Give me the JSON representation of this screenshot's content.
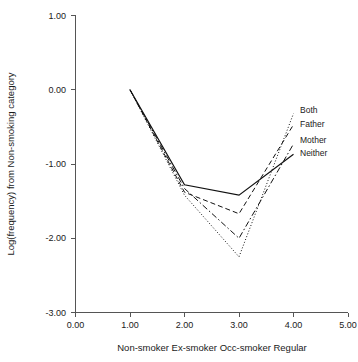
{
  "chart_data": {
    "type": "line",
    "title": "",
    "subtitle": "",
    "xlabel": "Non-smoker Ex-smoker Occ-smoker Regular",
    "ylabel": "Log(frequency) from Non-smoking category",
    "xlim": [
      0.0,
      5.0
    ],
    "ylim": [
      -3.0,
      1.0
    ],
    "xticks": [
      "0.00",
      "1.00",
      "2.00",
      "3.00",
      "4.00",
      "5.00"
    ],
    "xtick_values": [
      0.0,
      1.0,
      2.0,
      3.0,
      4.0,
      5.0
    ],
    "yticks": [
      "1.00",
      "0.00",
      "-1.00",
      "-2.00",
      "-3.00"
    ],
    "ytick_values": [
      1.0,
      0.0,
      -1.0,
      -2.0,
      -3.0
    ],
    "grid": false,
    "legend_position": "right-inside",
    "x": [
      1.0,
      2.0,
      3.0,
      4.0
    ],
    "x_category_labels": [
      "Non-smoker",
      "Ex-smoker",
      "Occ-smoker",
      "Regular"
    ],
    "series": [
      {
        "name": "Both",
        "style": "dotted",
        "values": [
          0.0,
          -1.42,
          -2.25,
          -0.32
        ]
      },
      {
        "name": "Father",
        "style": "dashed",
        "values": [
          0.0,
          -1.38,
          -1.67,
          -0.47
        ]
      },
      {
        "name": "Mother",
        "style": "dash-dot",
        "values": [
          0.0,
          -1.33,
          -2.0,
          -0.73
        ]
      },
      {
        "name": "Neither",
        "style": "solid",
        "values": [
          0.0,
          -1.28,
          -1.42,
          -0.87
        ]
      }
    ]
  },
  "legend": {
    "items": [
      {
        "label": "Both"
      },
      {
        "label": "Father"
      },
      {
        "label": "Mother"
      },
      {
        "label": "Neither"
      }
    ]
  },
  "colors": {
    "line": "#111111",
    "axis": "#555555",
    "text": "#1a1a1a",
    "background": "#ffffff"
  }
}
